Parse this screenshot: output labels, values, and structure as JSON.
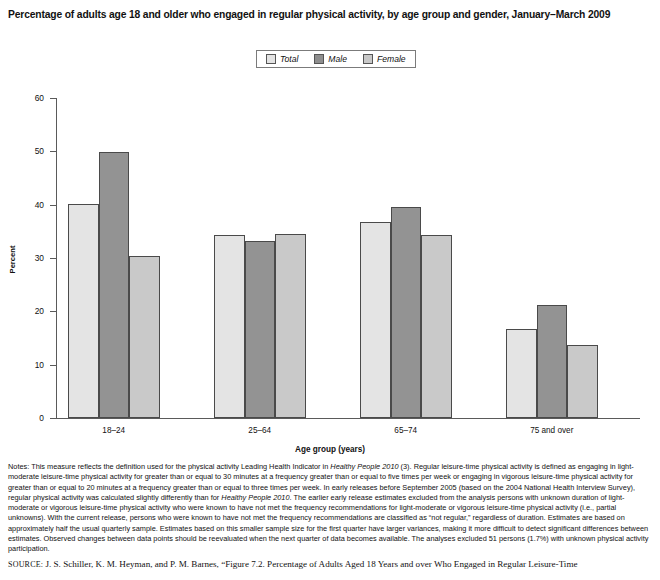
{
  "title": "Percentage of adults age 18 and older who engaged in regular physical activity, by age group and gender, January–March 2009",
  "legend": {
    "items": [
      {
        "label": "Total",
        "color": "#e4e4e4",
        "icon": "legend-swatch-total"
      },
      {
        "label": "Male",
        "color": "#939393",
        "icon": "legend-swatch-male"
      },
      {
        "label": "Female",
        "color": "#c9c9c9",
        "icon": "legend-swatch-female"
      }
    ]
  },
  "chart_data": {
    "type": "bar",
    "title": "Percentage of adults age 18 and older who engaged in regular physical activity, by age group and gender, January–March 2009",
    "xlabel": "Age group (years)",
    "ylabel": "Percent",
    "categories": [
      "18–24",
      "25–64",
      "65–74",
      "75 and over"
    ],
    "series": [
      {
        "name": "Total",
        "values": [
          40.2,
          34.3,
          36.7,
          16.7
        ]
      },
      {
        "name": "Male",
        "values": [
          49.8,
          33.1,
          39.5,
          21.1
        ]
      },
      {
        "name": "Female",
        "values": [
          30.3,
          34.5,
          34.3,
          13.6
        ]
      }
    ],
    "ylim": [
      0,
      60
    ],
    "yticks": [
      0,
      10,
      20,
      30,
      40,
      50,
      60
    ],
    "ytick_labels": [
      "0",
      "10",
      "20",
      "30",
      "40",
      "50",
      "60"
    ],
    "grid": false,
    "legend_position": "top-center"
  },
  "notes": {
    "lead": "Notes:",
    "text_1": " This measure reflects the definition used for the physical activity Leading Health Indicator in ",
    "italic_1": "Healthy People 2010",
    "text_2": " (3). Regular leisure-time physical activity is defined as engaging in light-moderate leisure-time physical activity for greater than or equal to 30 minutes at a frequency greater than or equal to five times per week or engaging in vigorous leisure-time physical activity for greater than or equal to 20 minutes at a frequency greater than or equal to three times per week. In early releases before September 2005 (based on the 2004 National Health Interview Survey), regular physical activity was calculated slightly differently than for ",
    "italic_2": "Healthy People 2010",
    "text_3": ". The earlier early release estimates excluded from the analysis persons with unknown duration of light-moderate or vigorous leisure-time physical activity who were known to have not met the frequency recommendations for light-moderate or vigorous leisure-time physical activity (i.e., partial unknowns). With the current release, persons who were known to have not met the frequency recommendations are classified as “not regular,” regardless of duration. Estimates are based on approximately half the usual quarterly sample. Estimates based on this smaller sample size for the first quarter have larger variances, making it more difficult to detect significant differences between estimates. Observed changes between data points should be reevaluated when the next quarter of data becomes available. The analyses excluded 51 persons (1.7%) with unknown physical activity participation."
  },
  "source": {
    "label": "SOURCE:",
    "text": " J. S. Schiller, K. M. Heyman, and P. M. Barnes, “Figure 7.2. Percentage of Adults Aged 18 Years and over Who Engaged in Regular Leisure-Time"
  }
}
